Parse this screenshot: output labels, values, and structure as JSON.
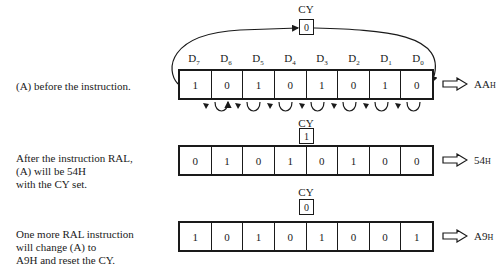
{
  "figure": {
    "bit_labels": [
      "D7",
      "D6",
      "D5",
      "D4",
      "D3",
      "D2",
      "D1",
      "D0"
    ],
    "cy_label": "CY",
    "rows": [
      {
        "caption": "(A) before the instruction.",
        "cy": "0",
        "bits": [
          "1",
          "0",
          "1",
          "0",
          "1",
          "0",
          "1",
          "0"
        ],
        "result_value": "AA",
        "result_suffix": "H"
      },
      {
        "caption": "After the instruction RAL,\n(A) will be 54H\nwith the CY set.",
        "cy": "1",
        "bits": [
          "0",
          "1",
          "0",
          "1",
          "0",
          "1",
          "0",
          "0"
        ],
        "result_value": "54",
        "result_suffix": "H"
      },
      {
        "caption": "One more RAL instruction\nwill change (A) to\nA9H and reset the CY.",
        "cy": "0",
        "bits": [
          "1",
          "0",
          "1",
          "0",
          "1",
          "0",
          "0",
          "1"
        ],
        "result_value": "A9",
        "result_suffix": "H"
      }
    ],
    "icons": {
      "result_arrow": "hollow-right-arrow-icon",
      "rotate_arrow": "curved-shift-left-arrow-icon",
      "carry_loop": "carry-loop-arrow"
    }
  }
}
